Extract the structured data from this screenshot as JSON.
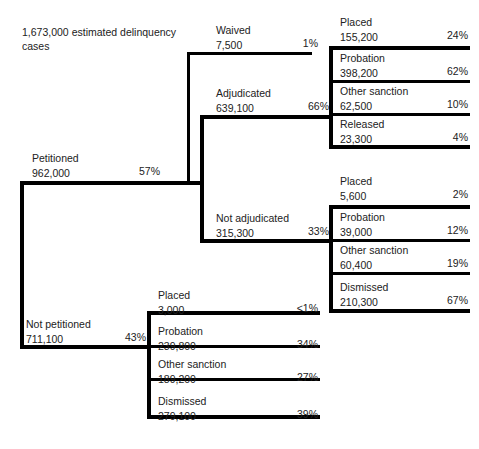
{
  "diagram": {
    "type": "flow-tree",
    "title_caption": "1,673,000 estimated delinquency cases",
    "total_cases": "1,673,000",
    "nodes": {
      "petitioned": {
        "label": "Petitioned",
        "value": "962,000",
        "percent": "57%"
      },
      "not_petitioned": {
        "label": "Not petitioned",
        "value": "711,100",
        "percent": "43%"
      },
      "waived": {
        "label": "Waived",
        "value": "7,500",
        "percent": "1%"
      },
      "adjudicated": {
        "label": "Adjudicated",
        "value": "639,100",
        "percent": "66%"
      },
      "not_adjudicated": {
        "label": "Not adjudicated",
        "value": "315,300",
        "percent": "33%"
      },
      "adj_placed": {
        "label": "Placed",
        "value": "155,200",
        "percent": "24%"
      },
      "adj_probation": {
        "label": "Probation",
        "value": "398,200",
        "percent": "62%"
      },
      "adj_other": {
        "label": "Other sanction",
        "value": "62,500",
        "percent": "10%"
      },
      "adj_released": {
        "label": "Released",
        "value": "23,300",
        "percent": "4%"
      },
      "notadj_placed": {
        "label": "Placed",
        "value": "5,600",
        "percent": "2%"
      },
      "notadj_probation": {
        "label": "Probation",
        "value": "39,000",
        "percent": "12%"
      },
      "notadj_other": {
        "label": "Other sanction",
        "value": "60,400",
        "percent": "19%"
      },
      "notadj_dismissed": {
        "label": "Dismissed",
        "value": "210,300",
        "percent": "67%"
      },
      "notpet_placed": {
        "label": "Placed",
        "value": "3,000",
        "percent": "<1%"
      },
      "notpet_probation": {
        "label": "Probation",
        "value": "239,800",
        "percent": "34%"
      },
      "notpet_other": {
        "label": "Other sanction",
        "value": "189,200",
        "percent": "27%"
      },
      "notpet_dismissed": {
        "label": "Dismissed",
        "value": "279,100",
        "percent": "39%"
      }
    },
    "colors": {
      "rule": "#000000",
      "text": "#222222",
      "background": "#ffffff"
    }
  }
}
